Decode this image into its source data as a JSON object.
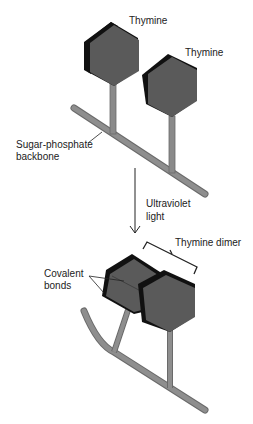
{
  "labels": {
    "thymine_1": "Thymine",
    "thymine_2": "Thymine",
    "backbone_line1": "Sugar-phosphate",
    "backbone_line2": "backbone",
    "uv_line1": "Ultraviolet",
    "uv_line2": "light",
    "dimer": "Thymine dimer",
    "covalent_line1": "Covalent",
    "covalent_line2": "bonds"
  },
  "colors": {
    "hex_face": "#5a5a5a",
    "hex_edge": "#111111",
    "backbone": "#8a8a8a",
    "backbone_edge": "#6a6a6a",
    "arrow": "#222222"
  }
}
